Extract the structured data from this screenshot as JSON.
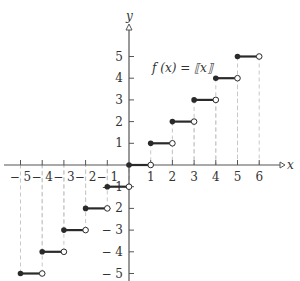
{
  "chart_data": {
    "type": "line",
    "function_label": "f (x) = ⟦x⟧",
    "xlabel": "x",
    "ylabel": "y",
    "xlim": [
      -5,
      6
    ],
    "ylim": [
      -5,
      5
    ],
    "x_ticks": [
      -5,
      -4,
      -3,
      -2,
      -1,
      1,
      2,
      3,
      4,
      5,
      6
    ],
    "y_ticks": [
      5,
      4,
      3,
      2,
      1,
      -1,
      -2,
      -3,
      -4,
      -5
    ],
    "x_tick_labels": [
      "− 5",
      "− 4",
      "− 3",
      "− 2",
      "− 1",
      "1",
      "2",
      "3",
      "4",
      "5",
      "6"
    ],
    "y_tick_labels": [
      "5",
      "4",
      "3",
      "2",
      "1",
      "− 1",
      "− 2",
      "− 3",
      "− 4",
      "− 5"
    ],
    "grid": false,
    "dashed_guides": true,
    "segments": [
      {
        "x_start": -5,
        "x_end": -4,
        "y": -5,
        "start": "closed",
        "end": "open"
      },
      {
        "x_start": -4,
        "x_end": -3,
        "y": -4,
        "start": "closed",
        "end": "open"
      },
      {
        "x_start": -3,
        "x_end": -2,
        "y": -3,
        "start": "closed",
        "end": "open"
      },
      {
        "x_start": -2,
        "x_end": -1,
        "y": -2,
        "start": "closed",
        "end": "open"
      },
      {
        "x_start": -1,
        "x_end": 0,
        "y": -1,
        "start": "closed",
        "end": "open"
      },
      {
        "x_start": 0,
        "x_end": 1,
        "y": 0,
        "start": "closed",
        "end": "open"
      },
      {
        "x_start": 1,
        "x_end": 2,
        "y": 1,
        "start": "closed",
        "end": "open"
      },
      {
        "x_start": 2,
        "x_end": 3,
        "y": 2,
        "start": "closed",
        "end": "open"
      },
      {
        "x_start": 3,
        "x_end": 4,
        "y": 3,
        "start": "closed",
        "end": "open"
      },
      {
        "x_start": 4,
        "x_end": 5,
        "y": 4,
        "start": "closed",
        "end": "open"
      },
      {
        "x_start": 5,
        "x_end": 6,
        "y": 5,
        "start": "closed",
        "end": "open"
      }
    ]
  },
  "labels": {
    "x_axis": "x",
    "y_axis": "y",
    "function": "f (x) = ⟦x⟧"
  },
  "colors": {
    "axis": "#555555",
    "segment": "#2a2a2a",
    "guide": "#c8c8c8"
  }
}
